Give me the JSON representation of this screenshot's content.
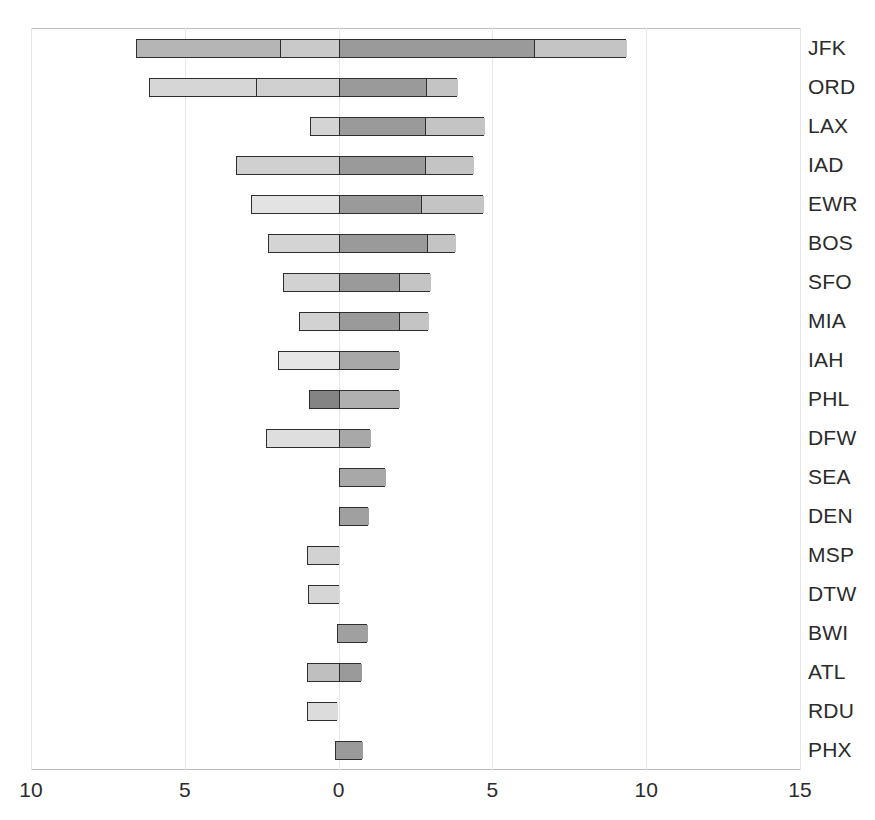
{
  "chart_data": {
    "type": "bar",
    "orientation": "horizontal",
    "stacked": true,
    "diverging": true,
    "title": "",
    "subtitle": "",
    "xlabel": "",
    "ylabel": "",
    "grid": true,
    "legend": "none",
    "xlim": [
      -10,
      15
    ],
    "xticks": [
      -10,
      -5,
      0,
      5,
      10,
      15
    ],
    "xtick_labels": [
      "10",
      "5",
      "0",
      "5",
      "10",
      "15"
    ],
    "categories": [
      "JFK",
      "ORD",
      "LAX",
      "IAD",
      "EWR",
      "BOS",
      "SFO",
      "MIA",
      "IAH",
      "PHL",
      "DFW",
      "SEA",
      "DEN",
      "MSP",
      "DTW",
      "BWI",
      "ATL",
      "RDU",
      "PHX"
    ],
    "segment_shades": {
      "very_light": "#e9e9e9",
      "light": "#d8d8d8",
      "medium_light": "#cfcfcf",
      "medium": "#b8b8b8",
      "medium_dark": "#a4a4a4",
      "dark": "#8d8d8d",
      "very_dark": "#7a7a7a"
    },
    "bars": [
      {
        "category": "JFK",
        "start": -6.6,
        "end": 9.34,
        "total_span": 15.94,
        "segments": [
          {
            "from": -6.6,
            "to": -1.9,
            "value": 4.7,
            "shade": "#b5b5b5"
          },
          {
            "from": -1.9,
            "to": 0.0,
            "value": 1.9,
            "shade": "#c9c9c9"
          },
          {
            "from": 0.0,
            "to": 6.35,
            "value": 6.35,
            "shade": "#9a9a9a"
          },
          {
            "from": 6.35,
            "to": 9.34,
            "value": 2.99,
            "shade": "#c4c4c4"
          }
        ]
      },
      {
        "category": "ORD",
        "start": -6.16,
        "end": 3.84,
        "total_span": 10.0,
        "segments": [
          {
            "from": -6.16,
            "to": -2.7,
            "value": 3.46,
            "shade": "#d6d6d6"
          },
          {
            "from": -2.7,
            "to": 0.0,
            "value": 2.7,
            "shade": "#d0d0d0"
          },
          {
            "from": 0.0,
            "to": 2.83,
            "value": 2.83,
            "shade": "#9a9a9a"
          },
          {
            "from": 2.83,
            "to": 3.84,
            "value": 1.01,
            "shade": "#c4c4c4"
          }
        ]
      },
      {
        "category": "LAX",
        "start": -0.94,
        "end": 4.72,
        "total_span": 5.66,
        "segments": [
          {
            "from": -0.94,
            "to": 0.0,
            "value": 0.94,
            "shade": "#d4d4d4"
          },
          {
            "from": 0.0,
            "to": 2.8,
            "value": 2.8,
            "shade": "#9a9a9a"
          },
          {
            "from": 2.8,
            "to": 4.72,
            "value": 1.92,
            "shade": "#c4c4c4"
          }
        ]
      },
      {
        "category": "IAD",
        "start": -3.33,
        "end": 4.37,
        "total_span": 7.7,
        "segments": [
          {
            "from": -3.33,
            "to": 0.0,
            "value": 3.33,
            "shade": "#d0d0d0"
          },
          {
            "from": 0.0,
            "to": 2.8,
            "value": 2.8,
            "shade": "#9a9a9a"
          },
          {
            "from": 2.8,
            "to": 4.37,
            "value": 1.57,
            "shade": "#c4c4c4"
          }
        ]
      },
      {
        "category": "EWR",
        "start": -2.86,
        "end": 4.69,
        "total_span": 7.55,
        "segments": [
          {
            "from": -2.86,
            "to": 0.0,
            "value": 2.86,
            "shade": "#e3e3e3"
          },
          {
            "from": 0.0,
            "to": 2.67,
            "value": 2.67,
            "shade": "#9a9a9a"
          },
          {
            "from": 2.67,
            "to": 4.69,
            "value": 2.02,
            "shade": "#c4c4c4"
          }
        ]
      },
      {
        "category": "BOS",
        "start": -2.3,
        "end": 3.77,
        "total_span": 6.07,
        "segments": [
          {
            "from": -2.3,
            "to": 0.0,
            "value": 2.3,
            "shade": "#d4d4d4"
          },
          {
            "from": 0.0,
            "to": 2.86,
            "value": 2.86,
            "shade": "#9a9a9a"
          },
          {
            "from": 2.86,
            "to": 3.77,
            "value": 0.91,
            "shade": "#c4c4c4"
          }
        ]
      },
      {
        "category": "SFO",
        "start": -1.82,
        "end": 2.96,
        "total_span": 4.78,
        "segments": [
          {
            "from": -1.82,
            "to": 0.0,
            "value": 1.82,
            "shade": "#d2d2d2"
          },
          {
            "from": 0.0,
            "to": 1.95,
            "value": 1.95,
            "shade": "#9a9a9a"
          },
          {
            "from": 1.95,
            "to": 2.96,
            "value": 1.01,
            "shade": "#c4c4c4"
          }
        ]
      },
      {
        "category": "MIA",
        "start": -1.29,
        "end": 2.92,
        "total_span": 4.21,
        "segments": [
          {
            "from": -1.29,
            "to": 0.0,
            "value": 1.29,
            "shade": "#d2d2d2"
          },
          {
            "from": 0.0,
            "to": 1.95,
            "value": 1.95,
            "shade": "#9a9a9a"
          },
          {
            "from": 1.95,
            "to": 2.92,
            "value": 0.97,
            "shade": "#c4c4c4"
          }
        ]
      },
      {
        "category": "IAH",
        "start": -1.98,
        "end": 1.95,
        "total_span": 3.93,
        "segments": [
          {
            "from": -1.98,
            "to": 0.0,
            "value": 1.98,
            "shade": "#e6e6e6"
          },
          {
            "from": 0.0,
            "to": 1.95,
            "value": 1.95,
            "shade": "#a8a8a8"
          }
        ]
      },
      {
        "category": "PHL",
        "start": -0.97,
        "end": 1.95,
        "total_span": 2.92,
        "segments": [
          {
            "from": -0.97,
            "to": 0.0,
            "value": 0.97,
            "shade": "#848484"
          },
          {
            "from": 0.0,
            "to": 1.95,
            "value": 1.95,
            "shade": "#b0b0b0"
          }
        ]
      },
      {
        "category": "DFW",
        "start": -2.36,
        "end": 1.01,
        "total_span": 3.37,
        "segments": [
          {
            "from": -2.36,
            "to": 0.0,
            "value": 2.36,
            "shade": "#dedede"
          },
          {
            "from": 0.0,
            "to": 1.01,
            "value": 1.01,
            "shade": "#a8a8a8"
          }
        ]
      },
      {
        "category": "SEA",
        "start": 0.0,
        "end": 1.51,
        "total_span": 1.51,
        "segments": [
          {
            "from": 0.0,
            "to": 1.51,
            "value": 1.51,
            "shade": "#a8a8a8"
          }
        ]
      },
      {
        "category": "DEN",
        "start": 0.0,
        "end": 0.94,
        "total_span": 0.94,
        "segments": [
          {
            "from": 0.0,
            "to": 0.94,
            "value": 0.94,
            "shade": "#a0a0a0"
          }
        ]
      },
      {
        "category": "MSP",
        "start": -1.04,
        "end": 0.0,
        "total_span": 1.04,
        "segments": [
          {
            "from": -1.04,
            "to": 0.0,
            "value": 1.04,
            "shade": "#d2d2d2"
          }
        ]
      },
      {
        "category": "DTW",
        "start": -1.01,
        "end": 0.0,
        "total_span": 1.01,
        "segments": [
          {
            "from": -1.01,
            "to": 0.0,
            "value": 1.01,
            "shade": "#d6d6d6"
          }
        ]
      },
      {
        "category": "BWI",
        "start": -0.06,
        "end": 0.91,
        "total_span": 0.97,
        "segments": [
          {
            "from": -0.06,
            "to": 0.91,
            "value": 0.97,
            "shade": "#a0a0a0"
          }
        ]
      },
      {
        "category": "ATL",
        "start": -1.04,
        "end": 0.72,
        "total_span": 1.76,
        "segments": [
          {
            "from": -1.04,
            "to": 0.0,
            "value": 1.04,
            "shade": "#bfbfbf"
          },
          {
            "from": 0.0,
            "to": 0.72,
            "value": 0.72,
            "shade": "#9a9a9a"
          }
        ]
      },
      {
        "category": "RDU",
        "start": -1.04,
        "end": -0.06,
        "total_span": 0.98,
        "segments": [
          {
            "from": -1.04,
            "to": -0.06,
            "value": 0.98,
            "shade": "#dcdcdc"
          }
        ]
      },
      {
        "category": "PHX",
        "start": -0.13,
        "end": 0.75,
        "total_span": 0.88,
        "segments": [
          {
            "from": -0.13,
            "to": 0.75,
            "value": 0.88,
            "shade": "#9a9a9a"
          }
        ]
      }
    ]
  },
  "axis": {
    "tick_labels": [
      "10",
      "5",
      "0",
      "5",
      "10",
      "15"
    ],
    "tick_values": [
      -10,
      -5,
      0,
      5,
      10,
      15
    ]
  }
}
